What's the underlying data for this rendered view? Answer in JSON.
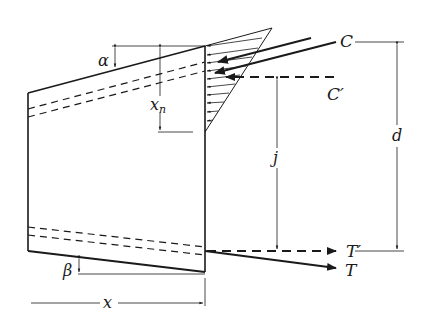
{
  "figure": {
    "type": "reinforced concrete beam with variable depth - internal force diagram",
    "colors": {
      "stroke": "#1a1a1a",
      "background": "#ffffff"
    }
  },
  "labels": {
    "alpha": "α",
    "beta": "β",
    "xn": "x",
    "xn_sub": "n",
    "x": "x",
    "j": "j",
    "d": "d",
    "C": "C",
    "C_prime": "C′",
    "T": "T",
    "T_prime": "T′"
  }
}
